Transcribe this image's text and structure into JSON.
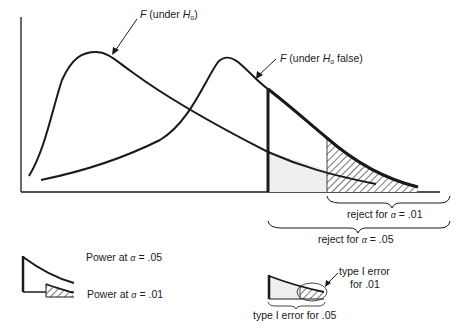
{
  "diagram": {
    "type": "statistical power illustration",
    "curves": {
      "h0": {
        "label_prefix": "F",
        "label_text": "(under ",
        "label_var": "H",
        "label_sub": "o",
        "label_suffix": ")"
      },
      "h0_false": {
        "label_prefix": "F",
        "label_text": "(under ",
        "label_var": "H",
        "label_sub": "o",
        "label_suffix": " false)"
      }
    },
    "regions": {
      "reject_01": {
        "prefix": "reject for ",
        "alpha": "α",
        "suffix": " = .01"
      },
      "reject_05": {
        "prefix": "reject for ",
        "alpha": "α",
        "suffix": " = .05"
      }
    },
    "legend": {
      "power_05": {
        "prefix": "Power at ",
        "alpha": "α",
        "suffix": " = .05"
      },
      "power_01": {
        "prefix": "Power at ",
        "alpha": "α",
        "suffix": " = .01"
      },
      "type1_01_line1": "type I error",
      "type1_01_line2": "for .01",
      "type1_05": "type I error for .05"
    },
    "colors": {
      "ink": "#1a1a1a",
      "light_fill": "#efefef",
      "background": "#ffffff"
    }
  }
}
